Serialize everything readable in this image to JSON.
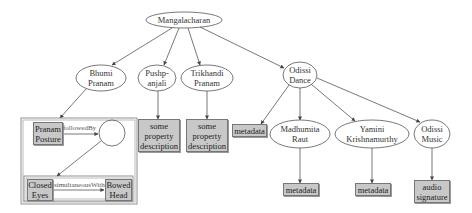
{
  "diagram": {
    "root": {
      "label": "Mangalacharan"
    },
    "children": [
      {
        "id": "bhumi",
        "label_line1": "Bhumi",
        "label_line2": "Pranam"
      },
      {
        "id": "pushp",
        "label_line1": "Pushp-",
        "label_line2": "anjali"
      },
      {
        "id": "trikhandi",
        "label_line1": "Trikhandi",
        "label_line2": "Pranam"
      },
      {
        "id": "odissi_dance",
        "label_line1": "Odissi",
        "label_line2": "Dance"
      }
    ],
    "odissi_children": [
      {
        "id": "madhumita",
        "label_line1": "Madhumita",
        "label_line2": "Raut"
      },
      {
        "id": "yamini",
        "label_line1": "Yamini",
        "label_line2": "Krishnamurthy"
      },
      {
        "id": "odissi_music",
        "label_line1": "Odissi",
        "label_line2": "Music"
      }
    ],
    "property_boxes": {
      "pushp": {
        "line1": "some",
        "line2": "property",
        "line3": "description"
      },
      "trikhandi": {
        "line1": "some",
        "line2": "property",
        "line3": "description"
      },
      "odissi_dance": {
        "label": "metadata"
      },
      "madhumita": {
        "label": "metadata"
      },
      "yamini": {
        "label": "metadata"
      },
      "odissi_music": {
        "line1": "audio",
        "line2": "signature"
      }
    },
    "bhumi_detail": {
      "pranam_posture": {
        "line1": "Pranam",
        "line2": "Posture"
      },
      "followed_by": "followedBy",
      "closed_eyes": {
        "line1": "Closed",
        "line2": "Eyes"
      },
      "simultaneous_with": "simultaneousWith",
      "bowed_head": {
        "line1": "Bowed",
        "line2": "Head"
      }
    }
  }
}
